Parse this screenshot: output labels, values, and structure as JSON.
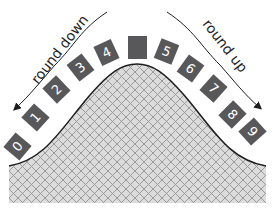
{
  "diagram": {
    "labels": {
      "left": "round down",
      "right": "round up"
    },
    "colors": {
      "box": "#58585a",
      "digit_text": "#ffffff",
      "curve_line": "#1e1e1e",
      "hatch_bg": "#dcdcdc",
      "hatch_line": "#9a9a9a"
    },
    "boxes": [
      {
        "label": "0",
        "cx": 17,
        "cy": 146,
        "rot": -50
      },
      {
        "label": "1",
        "cx": 35,
        "cy": 117,
        "rot": -48
      },
      {
        "label": "2",
        "cx": 56,
        "cy": 89,
        "rot": -44
      },
      {
        "label": "3",
        "cx": 80,
        "cy": 67,
        "rot": -38
      },
      {
        "label": "4",
        "cx": 106,
        "cy": 52,
        "rot": -25
      },
      {
        "label": "",
        "cx": 137,
        "cy": 46,
        "rot": 0
      },
      {
        "label": "5",
        "cx": 166,
        "cy": 51,
        "rot": 22
      },
      {
        "label": "6",
        "cx": 190,
        "cy": 68,
        "rot": 36
      },
      {
        "label": "7",
        "cx": 213,
        "cy": 88,
        "rot": 42
      },
      {
        "label": "8",
        "cx": 232,
        "cy": 114,
        "rot": 45
      },
      {
        "label": "9",
        "cx": 252,
        "cy": 131,
        "rot": 48
      }
    ]
  }
}
